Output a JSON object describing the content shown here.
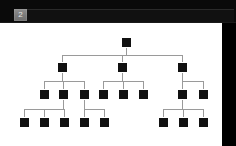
{
  "header": {
    "page_badge_label": "2",
    "badge_color": "#7a7a7a",
    "bar_color": "#0a0a0a"
  },
  "slide": {
    "background_color": "#ffffff",
    "node_color": "#111111",
    "connector_color": "#9a9a9a",
    "node_size": 9,
    "title": "",
    "diagram_type": "organization-tree"
  },
  "chart_data": {
    "type": "tree",
    "title": "",
    "node_count": 20,
    "depth": 4,
    "levels": [
      {
        "level": 1,
        "y": 42,
        "count": 1,
        "nodes": [
          {
            "id": "n1",
            "x": 126,
            "label": ""
          }
        ]
      },
      {
        "level": 2,
        "y": 67,
        "count": 3,
        "nodes": [
          {
            "id": "n2",
            "x": 62,
            "parent": "n1",
            "label": ""
          },
          {
            "id": "n3",
            "x": 122,
            "parent": "n1",
            "label": ""
          },
          {
            "id": "n4",
            "x": 182,
            "parent": "n1",
            "label": ""
          }
        ]
      },
      {
        "level": 3,
        "y": 94,
        "count": 8,
        "nodes": [
          {
            "id": "n5",
            "x": 44,
            "parent": "n2",
            "label": ""
          },
          {
            "id": "n6",
            "x": 63,
            "parent": "n2",
            "label": ""
          },
          {
            "id": "n7",
            "x": 84,
            "parent": "n2",
            "label": ""
          },
          {
            "id": "n8",
            "x": 103,
            "parent": "n3",
            "label": ""
          },
          {
            "id": "n9",
            "x": 123,
            "parent": "n3",
            "label": ""
          },
          {
            "id": "n10",
            "x": 143,
            "parent": "n3",
            "label": ""
          },
          {
            "id": "n11",
            "x": 182,
            "parent": "n4",
            "label": ""
          },
          {
            "id": "n12",
            "x": 203,
            "parent": "n4",
            "label": ""
          }
        ]
      },
      {
        "level": 4,
        "y": 122,
        "count": 8,
        "nodes": [
          {
            "id": "n13",
            "x": 24,
            "parent": "n6",
            "label": ""
          },
          {
            "id": "n14",
            "x": 44,
            "parent": "n6",
            "label": ""
          },
          {
            "id": "n15",
            "x": 64,
            "parent": "n6",
            "label": ""
          },
          {
            "id": "n16",
            "x": 84,
            "parent": "n7",
            "label": ""
          },
          {
            "id": "n17",
            "x": 104,
            "parent": "n7",
            "label": ""
          },
          {
            "id": "n18",
            "x": 163,
            "parent": "n11",
            "label": ""
          },
          {
            "id": "n19",
            "x": 183,
            "parent": "n11",
            "label": ""
          },
          {
            "id": "n20",
            "x": 203,
            "parent": "n11",
            "label": ""
          }
        ]
      }
    ],
    "connectors": [
      {
        "from": "n1",
        "bus_y": 55,
        "children_x": [
          62,
          122,
          182
        ]
      },
      {
        "from": "n2",
        "bus_y": 81,
        "children_x": [
          44,
          63,
          84
        ]
      },
      {
        "from": "n3",
        "bus_y": 81,
        "children_x": [
          103,
          123,
          143
        ]
      },
      {
        "from": "n4",
        "bus_y": 81,
        "children_x": [
          182,
          203
        ]
      },
      {
        "from": "n6",
        "bus_y": 109,
        "children_x": [
          24,
          44,
          64
        ]
      },
      {
        "from": "n7",
        "bus_y": 109,
        "children_x": [
          84,
          104
        ]
      },
      {
        "from": "n11",
        "bus_y": 109,
        "children_x": [
          163,
          183,
          203
        ]
      }
    ]
  }
}
